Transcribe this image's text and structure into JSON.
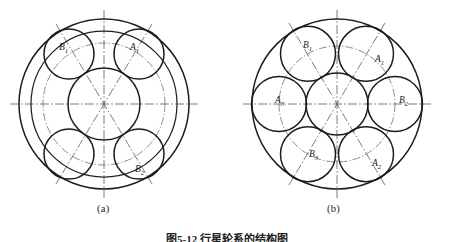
{
  "figure": {
    "caption": "图5-12  行星轮系的结构图",
    "background_color": "#ffffff",
    "line_color": "#1c1c1c",
    "centerline_color": "#5a5a5a"
  },
  "diagrams": [
    {
      "id": "a",
      "subcaption": "(a)",
      "description": "planetary gear train with four planet gears",
      "center": {
        "x": 104,
        "y": 104
      },
      "outer_circle": {
        "cx": 104,
        "cy": 104,
        "r": 85,
        "style": "solid-heavy"
      },
      "ring_circle": {
        "cx": 104,
        "cy": 104,
        "r": 73,
        "style": "solid-med"
      },
      "sun_circle": {
        "cx": 104,
        "cy": 104,
        "r": 36,
        "style": "solid-heavy"
      },
      "pitch_circle": {
        "cx": 104,
        "cy": 104,
        "r": 61,
        "style": "pitchline"
      },
      "planet_radius": 25,
      "planets": [
        {
          "label": "B1",
          "label_text": "B",
          "label_sub": "1",
          "angle_deg": 125,
          "cx": 69.0,
          "cy": 54.0,
          "label_x": 60,
          "label_y": 47
        },
        {
          "label": "A1",
          "label_text": "A",
          "label_sub": "1",
          "angle_deg": 55,
          "cx": 139.0,
          "cy": 54.0,
          "label_x": 131,
          "label_y": 47
        },
        {
          "label": "",
          "label_text": "",
          "label_sub": "",
          "angle_deg": 235,
          "cx": 69.0,
          "cy": 154.0,
          "label_x": 0,
          "label_y": 0
        },
        {
          "label": "B2",
          "label_text": "B",
          "label_sub": "2",
          "angle_deg": 305,
          "cx": 139.0,
          "cy": 154.0,
          "label_x": 137,
          "label_y": 172
        }
      ],
      "axis_lines": [
        {
          "name": "horizontal-centerline",
          "x1": 10,
          "y1": 104,
          "x2": 198,
          "y2": 104
        },
        {
          "name": "vertical-centerline",
          "x1": 104,
          "y1": 10,
          "x2": 104,
          "y2": 198
        },
        {
          "name": "diagonal-centerline-1",
          "x1": 56,
          "y1": 24,
          "x2": 152,
          "y2": 184
        },
        {
          "name": "diagonal-centerline-2",
          "x1": 152,
          "y1": 24,
          "x2": 56,
          "y2": 184
        }
      ]
    },
    {
      "id": "b",
      "subcaption": "(b)",
      "description": "planetary gear train with six planet gears",
      "center": {
        "x": 110,
        "y": 104
      },
      "outer_circle": {
        "cx": 110,
        "cy": 104,
        "r": 85,
        "style": "solid-heavy"
      },
      "sun_circle": {
        "cx": 110,
        "cy": 104,
        "r": 31,
        "style": "solid-heavy"
      },
      "pitch_circle": {
        "cx": 110,
        "cy": 104,
        "r": 58,
        "style": "pitchline"
      },
      "planet_radius": 27.5,
      "planets": [
        {
          "label": "B1",
          "label_text": "B",
          "label_sub": "1",
          "angle_deg": 120,
          "cx": 81.0,
          "cy": 53.8,
          "label_x": 78,
          "label_y": 45
        },
        {
          "label": "A1",
          "label_text": "A",
          "label_sub": "1",
          "angle_deg": 60,
          "cx": 139.0,
          "cy": 53.8,
          "label_x": 136,
          "label_y": 62
        },
        {
          "label": "B2",
          "label_text": "B",
          "label_sub": "2",
          "angle_deg": 0,
          "cx": 168.0,
          "cy": 104.0,
          "label_x": 168,
          "label_y": 104
        },
        {
          "label": "A2",
          "label_text": "A",
          "label_sub": "2",
          "angle_deg": 300,
          "cx": 139.0,
          "cy": 154.2,
          "label_x": 143,
          "label_y": 163
        },
        {
          "label": "B3",
          "label_text": "B",
          "label_sub": "3",
          "angle_deg": 240,
          "cx": 81.0,
          "cy": 154.2,
          "label_x": 82,
          "label_y": 155
        },
        {
          "label": "A3",
          "label_text": "A",
          "label_sub": "3",
          "angle_deg": 180,
          "cx": 52.0,
          "cy": 104.0,
          "label_x": 50,
          "label_y": 101
        }
      ],
      "axis_lines": [
        {
          "name": "horizontal-centerline",
          "x1": 16,
          "y1": 104,
          "x2": 204,
          "y2": 104
        },
        {
          "name": "vertical-centerline",
          "x1": 110,
          "y1": 10,
          "x2": 110,
          "y2": 198
        },
        {
          "name": "diagonal-centerline-1",
          "x1": 62,
          "y1": 23,
          "x2": 158,
          "y2": 185
        },
        {
          "name": "diagonal-centerline-2",
          "x1": 158,
          "y1": 23,
          "x2": 62,
          "y2": 185
        }
      ]
    }
  ]
}
